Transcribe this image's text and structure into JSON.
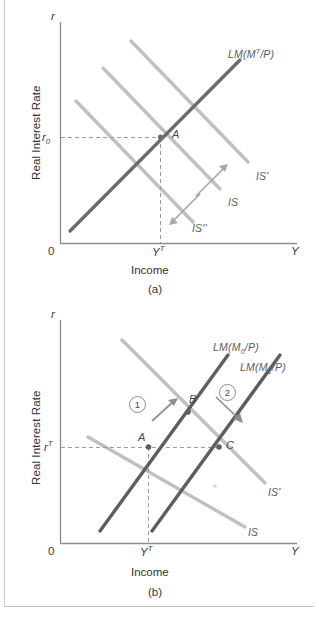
{
  "figure": {
    "type": "economics-diagram",
    "panels": [
      {
        "id": "a",
        "caption": "(a)",
        "axis": {
          "y_var": "r",
          "y_title": "Real Interest Rate",
          "x_var": "Y",
          "x_title": "Income",
          "origin_label": "0"
        },
        "ticks": {
          "y_tick_label_main": "r",
          "y_tick_label_sub": "0",
          "x_tick_label_main": "Y",
          "x_tick_label_sup": "T"
        },
        "curves": [
          {
            "name": "LM",
            "label_main": "LM(M",
            "label_sup": "T",
            "label_tail": "/P)",
            "color": "#6b6b6b",
            "kind": "lm"
          },
          {
            "name": "IS-prime",
            "label": "IS'",
            "color": "#bdbdbd",
            "kind": "is"
          },
          {
            "name": "IS",
            "label": "IS",
            "color": "#bdbdbd",
            "kind": "is"
          },
          {
            "name": "IS-double-prime",
            "label": "IS''",
            "color": "#bdbdbd",
            "kind": "is"
          }
        ],
        "points": [
          {
            "label": "A",
            "role": "equilibrium"
          }
        ],
        "arrows": [
          {
            "name": "shift-up-arrow",
            "direction": "up-right"
          },
          {
            "name": "shift-down-arrow",
            "direction": "down-left"
          }
        ]
      },
      {
        "id": "b",
        "caption": "(b)",
        "axis": {
          "y_var": "r",
          "y_title": "Real Interest Rate",
          "x_var": "Y",
          "x_title": "Income",
          "origin_label": "0"
        },
        "ticks": {
          "y_tick_label_main": "r",
          "y_tick_label_sup": "T",
          "x_tick_label_main": "Y",
          "x_tick_label_sup": "T"
        },
        "curves": [
          {
            "name": "LM0",
            "label_main": "LM(M",
            "label_sub": "0",
            "label_tail": "/P)",
            "color": "#5e5e5e",
            "kind": "lm"
          },
          {
            "name": "LM1",
            "label_main": "LM(M",
            "label_sub": "1",
            "label_tail": "/P)",
            "color": "#5e5e5e",
            "kind": "lm"
          },
          {
            "name": "IS-prime",
            "label": "IS'",
            "color": "#bdbdbd",
            "kind": "is"
          },
          {
            "name": "IS",
            "label": "IS",
            "color": "#bdbdbd",
            "kind": "is"
          }
        ],
        "points": [
          {
            "label": "A",
            "role": "initial-equilibrium"
          },
          {
            "label": "B",
            "role": "intermediate-equilibrium"
          },
          {
            "label": "C",
            "role": "final-equilibrium"
          }
        ],
        "steps": [
          {
            "number": "1",
            "name": "step-one",
            "direction": "up-right"
          },
          {
            "number": "2",
            "name": "step-two",
            "direction": "down-right"
          }
        ]
      }
    ],
    "colors": {
      "lm_dark": "#5e5e5e",
      "lm_darker": "#6b6b6b",
      "is_light": "#bdbdbd",
      "axis": "#8f8f8f",
      "dashed": "#9a9a9a",
      "text": "#3a3a3a",
      "frame": "#c9c9c9"
    }
  }
}
